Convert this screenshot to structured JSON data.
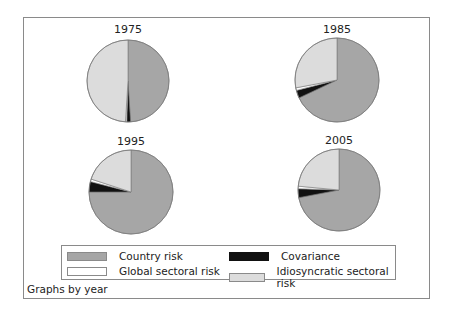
{
  "chart_data": {
    "type": "pie",
    "title": "",
    "note": "Graphs by year",
    "legend": {
      "position": "bottom",
      "entries": [
        {
          "label": "Country risk",
          "color": "#a6a6a6"
        },
        {
          "label": "Covariance",
          "color": "#111111"
        },
        {
          "label": "Global sectoral risk",
          "color": "#ffffff"
        },
        {
          "label": "Idiosyncratic sectoral risk",
          "color": "#dcdcdc"
        }
      ]
    },
    "categories": [
      "Country risk",
      "Covariance",
      "Global sectoral risk",
      "Idiosyncratic sectoral risk"
    ],
    "panels": [
      {
        "title": "1975",
        "values": [
          49,
          1.5,
          0.5,
          49
        ]
      },
      {
        "title": "1985",
        "values": [
          68,
          3,
          1,
          28
        ]
      },
      {
        "title": "1995",
        "values": [
          75,
          4,
          1,
          20
        ]
      },
      {
        "title": "2005",
        "values": [
          72,
          3.5,
          1,
          23.5
        ]
      }
    ]
  },
  "ui": {
    "legend_labels": [
      "Country risk",
      "Covariance",
      "Global sectoral risk",
      "Idiosyncratic sectoral risk"
    ],
    "panel_titles": [
      "1975",
      "1985",
      "1995",
      "2005"
    ],
    "note": "Graphs by year"
  }
}
